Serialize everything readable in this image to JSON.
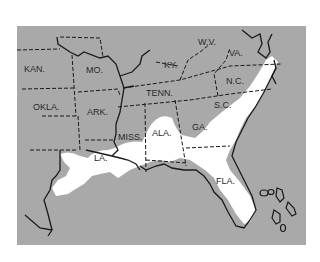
{
  "map": {
    "colors": {
      "land": "#a9a9a9",
      "highlight": "#ffffff",
      "border": "#1a1a1a",
      "background": "#ffffff"
    },
    "labels": {
      "kan": "KAN.",
      "mo": "MO.",
      "ky": "KY.",
      "wv": "W.V.",
      "va": "VA.",
      "okla": "OKLA.",
      "ark": "ARK.",
      "tenn": "TENN.",
      "nc": "N.C.",
      "sc": "S.C.",
      "miss": "MISS.",
      "ala": "ALA.",
      "ga": "GA.",
      "la": "LA.",
      "fla": "FLA."
    }
  }
}
